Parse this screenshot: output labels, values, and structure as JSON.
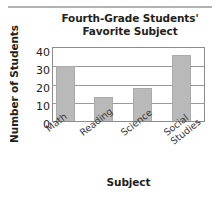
{
  "chart_data": {
    "type": "bar",
    "title": "Fourth-Grade Students' Favorite Subject",
    "title_line1": "Fourth-Grade Students'",
    "title_line2": "Favorite Subject",
    "xlabel": "Subject",
    "ylabel": "Number of Students",
    "categories": [
      "Math",
      "Reading",
      "Science",
      "Social Studies"
    ],
    "values": [
      30,
      13,
      18,
      36
    ],
    "ylim": [
      0,
      40
    ],
    "yticks": [
      "40",
      "30",
      "20",
      "10",
      "0"
    ],
    "ytick_values": [
      40,
      30,
      20,
      10,
      0
    ],
    "grid": "horizontal",
    "legend": "none",
    "bar_color": "#b9b9b9",
    "frame_color": "#8c8c8c",
    "gridline_color": "#9a9a9a",
    "xtick_rotation": -38,
    "xtick_labels": [
      {
        "line1": "Math",
        "line2": ""
      },
      {
        "line1": "Reading",
        "line2": ""
      },
      {
        "line1": "Science",
        "line2": ""
      },
      {
        "line1": "Social",
        "line2": "Studies"
      }
    ]
  }
}
